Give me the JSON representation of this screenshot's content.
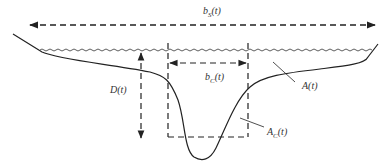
{
  "diagram": {
    "labels": {
      "surface_width": {
        "symbol": "b",
        "sub": "S",
        "arg": "(t)"
      },
      "channel_width": {
        "symbol": "b",
        "sub": "C",
        "arg": "(t)"
      },
      "depth": {
        "text": "D(t)"
      },
      "total_area": {
        "text": "A(t)"
      },
      "channel_area": {
        "symbol": "A",
        "sub": "C",
        "arg": "(t)"
      }
    },
    "colors": {
      "stroke": "#222222",
      "text": "#333333",
      "background": "#ffffff"
    }
  }
}
